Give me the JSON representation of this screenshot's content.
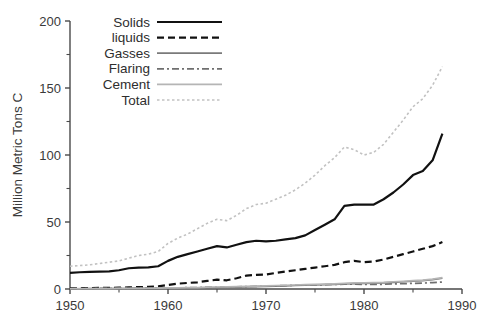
{
  "chart_data": {
    "type": "line",
    "title": "",
    "xlabel": "",
    "ylabel": "Million Metric Tons C",
    "xlim": [
      1950,
      1990
    ],
    "ylim": [
      0,
      200
    ],
    "xticks": [
      1950,
      1960,
      1970,
      1980,
      1990
    ],
    "xtick_labels": [
      "1950",
      "1960",
      "1970",
      "1980",
      "1990"
    ],
    "x_minor_ticks": [
      1955,
      1965,
      1975,
      1985
    ],
    "yticks": [
      0,
      50,
      100,
      150,
      200
    ],
    "ytick_labels": [
      "0",
      "50",
      "100",
      "150",
      "200"
    ],
    "y_minor_ticks": [
      25,
      75,
      125,
      175
    ],
    "grid": false,
    "legend_position": "top-left-inside",
    "x": [
      1950,
      1951,
      1952,
      1953,
      1954,
      1955,
      1956,
      1957,
      1958,
      1959,
      1960,
      1961,
      1962,
      1963,
      1964,
      1965,
      1966,
      1967,
      1968,
      1969,
      1970,
      1971,
      1972,
      1973,
      1974,
      1975,
      1976,
      1977,
      1978,
      1979,
      1980,
      1981,
      1982,
      1983,
      1984,
      1985,
      1986,
      1987,
      1988
    ],
    "series": [
      {
        "name": "Solids",
        "color": "#111111",
        "style": "solid",
        "values": [
          12,
          12.5,
          12.8,
          13,
          13.2,
          14,
          15.5,
          16,
          16.2,
          17,
          21,
          24,
          26,
          28,
          30,
          32,
          31,
          33,
          35,
          36,
          35.5,
          36,
          37,
          38,
          40,
          44,
          48,
          52,
          62,
          63,
          63,
          63,
          67,
          72,
          78,
          85,
          88,
          96,
          116
        ]
      },
      {
        "name": "liquids",
        "color": "#111111",
        "style": "dashed",
        "values": [
          0.5,
          0.6,
          0.7,
          0.8,
          0.9,
          1,
          1.2,
          1.4,
          1.6,
          2,
          3,
          4,
          4.5,
          5,
          6,
          7,
          6.5,
          8,
          10,
          10.5,
          10.8,
          12,
          13,
          14,
          15,
          16,
          17,
          18,
          20,
          21,
          20,
          20.5,
          22,
          24,
          26,
          28,
          30,
          32,
          35
        ]
      },
      {
        "name": "Gasses",
        "color": "#7a7a7a",
        "style": "solid",
        "values": [
          0.2,
          0.2,
          0.2,
          0.25,
          0.3,
          0.3,
          0.35,
          0.4,
          0.4,
          0.5,
          0.6,
          0.7,
          0.8,
          0.9,
          1,
          1.1,
          1.2,
          1.4,
          1.6,
          1.8,
          2,
          2.2,
          2.4,
          2.6,
          2.8,
          3,
          3.2,
          3.5,
          3.8,
          4,
          4.2,
          4.4,
          4.6,
          5,
          5.4,
          5.8,
          6.2,
          7,
          8
        ]
      },
      {
        "name": "Flaring",
        "color": "#6f6f6f",
        "style": "dashdot",
        "values": [
          0.3,
          0.3,
          0.35,
          0.4,
          0.4,
          0.5,
          0.5,
          0.6,
          0.6,
          0.7,
          0.8,
          0.9,
          1,
          1.1,
          1.2,
          1.3,
          1.4,
          1.6,
          1.8,
          2,
          2.2,
          2.4,
          2.6,
          2.8,
          3,
          3,
          3.2,
          3.4,
          3.6,
          3.6,
          3.4,
          3.4,
          3.5,
          3.8,
          4,
          4.2,
          4.4,
          4.8,
          5.2
        ]
      },
      {
        "name": "Cement",
        "color": "#b5b5b5",
        "style": "solid",
        "values": [
          0.2,
          0.25,
          0.3,
          0.3,
          0.35,
          0.4,
          0.45,
          0.5,
          0.55,
          0.6,
          0.8,
          0.9,
          1,
          1.1,
          1.3,
          1.5,
          1.6,
          1.8,
          2,
          2.2,
          2.4,
          2.6,
          2.8,
          3,
          3.2,
          3.4,
          3.6,
          3.8,
          4.2,
          4.5,
          4.6,
          4.8,
          5,
          5.4,
          5.8,
          6.2,
          6.6,
          7.4,
          8.5
        ]
      },
      {
        "name": "Total",
        "color": "#c2c2c2",
        "style": "dotted",
        "values": [
          17,
          17.5,
          18,
          19,
          20,
          21,
          23,
          25,
          26,
          28,
          34,
          38,
          41,
          45,
          49,
          52,
          51,
          55,
          60,
          63,
          64,
          67,
          70,
          74,
          79,
          85,
          92,
          98,
          106,
          104,
          100,
          102,
          108,
          117,
          126,
          136,
          142,
          152,
          166
        ]
      }
    ]
  },
  "legend": {
    "entries": [
      {
        "label": "Solids"
      },
      {
        "label": "liquids"
      },
      {
        "label": "Gasses"
      },
      {
        "label": "Flaring"
      },
      {
        "label": "Cement"
      },
      {
        "label": "Total"
      }
    ]
  }
}
